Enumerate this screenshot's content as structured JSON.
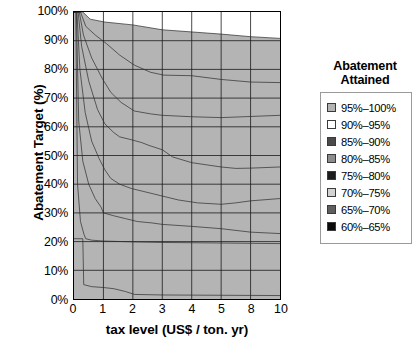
{
  "chart_data": {
    "type": "area",
    "title": "",
    "xlabel": "tax level (US$ / ton. yr)",
    "ylabel": "Abatement Target (%)",
    "legend_title_line1": "Abatement",
    "legend_title_line2": "Attained",
    "legend_position": "right",
    "grid": true,
    "xticks": [
      "0",
      "1",
      "2",
      "3",
      "4",
      "5",
      "8",
      "10"
    ],
    "xtick_values": [
      0,
      1,
      2,
      3,
      4,
      5,
      8,
      10
    ],
    "yticks": [
      "0%",
      "10%",
      "20%",
      "30%",
      "40%",
      "50%",
      "60%",
      "70%",
      "80%",
      "90%",
      "100%"
    ],
    "ytick_values": [
      0,
      10,
      20,
      30,
      40,
      50,
      60,
      70,
      80,
      90,
      100
    ],
    "ylim": [
      0,
      100
    ],
    "xlim": [
      0,
      10
    ],
    "x_scale": "ordinal",
    "legend": [
      {
        "label": "95%–100%",
        "color": "#b4b4b4",
        "low": 95,
        "high": 100
      },
      {
        "label": "90%–95%",
        "color": "#ffffff",
        "low": 90,
        "high": 95
      },
      {
        "label": "85%–90%",
        "color": "#4a4a4a",
        "low": 85,
        "high": 90
      },
      {
        "label": "80%–85%",
        "color": "#8c8c8c",
        "low": 80,
        "high": 85
      },
      {
        "label": "75%–80%",
        "color": "#1c1c1c",
        "low": 75,
        "high": 80
      },
      {
        "label": "70%–75%",
        "color": "#d2d2d2",
        "low": 70,
        "high": 75
      },
      {
        "label": "65%–70%",
        "color": "#5e5e5e",
        "low": 65,
        "high": 70
      },
      {
        "label": "60%–65%",
        "color": "#0a0a0a",
        "low": 60,
        "high": 65
      }
    ],
    "contour_boundaries": [
      {
        "name": "upper_edge_95_100",
        "points": [
          [
            0,
            100
          ],
          [
            0.3,
            100
          ],
          [
            0.55,
            97.5
          ],
          [
            1.05,
            96.5
          ],
          [
            2.0,
            95.5
          ],
          [
            3.0,
            93.8
          ],
          [
            5.0,
            92.3
          ],
          [
            8.0,
            91.4
          ],
          [
            10,
            90.8
          ]
        ]
      },
      {
        "name": "upper_edge_90_95",
        "points": [
          [
            0,
            100
          ],
          [
            0.22,
            100
          ],
          [
            0.4,
            95.0
          ],
          [
            0.72,
            92.0
          ],
          [
            1.1,
            89.0
          ],
          [
            1.55,
            85.0
          ],
          [
            2.05,
            81.5
          ],
          [
            2.6,
            79.0
          ],
          [
            3.05,
            78.0
          ],
          [
            4.0,
            77.8
          ],
          [
            5.0,
            76.5
          ],
          [
            8.0,
            75.6
          ],
          [
            10,
            75.4
          ]
        ]
      },
      {
        "name": "upper_edge_85_90",
        "points": [
          [
            0,
            100
          ],
          [
            0.18,
            100
          ],
          [
            0.32,
            92.0
          ],
          [
            0.6,
            84.0
          ],
          [
            0.95,
            77.0
          ],
          [
            1.25,
            72.0
          ],
          [
            1.6,
            68.5
          ],
          [
            2.05,
            65.5
          ],
          [
            2.6,
            64.5
          ],
          [
            3.0,
            64.0
          ],
          [
            4.0,
            63.5
          ],
          [
            5.0,
            63.2
          ],
          [
            8.0,
            63.6
          ],
          [
            10,
            64.0
          ]
        ]
      },
      {
        "name": "upper_edge_80_85",
        "points": [
          [
            0,
            100
          ],
          [
            0.14,
            100
          ],
          [
            0.26,
            88.0
          ],
          [
            0.5,
            76.0
          ],
          [
            0.8,
            66.0
          ],
          [
            1.05,
            61.0
          ],
          [
            1.35,
            58.0
          ],
          [
            1.55,
            56.5
          ],
          [
            1.95,
            55.5
          ],
          [
            2.3,
            54.5
          ],
          [
            2.55,
            53.5
          ],
          [
            3.0,
            52.0
          ],
          [
            3.35,
            49.5
          ],
          [
            4.0,
            47.5
          ],
          [
            5.0,
            46.0
          ],
          [
            6.5,
            45.5
          ],
          [
            8.0,
            45.6
          ],
          [
            10,
            46.0
          ]
        ]
      },
      {
        "name": "upper_edge_75_80",
        "points": [
          [
            0,
            100
          ],
          [
            0.1,
            100
          ],
          [
            0.2,
            80.0
          ],
          [
            0.38,
            65.0
          ],
          [
            0.6,
            55.0
          ],
          [
            0.85,
            49.0
          ],
          [
            1.05,
            45.0
          ],
          [
            1.25,
            42.0
          ],
          [
            1.55,
            40.0
          ],
          [
            1.95,
            38.5
          ],
          [
            2.35,
            37.5
          ],
          [
            2.95,
            36.0
          ],
          [
            3.55,
            34.5
          ],
          [
            4.2,
            33.5
          ],
          [
            5.0,
            33.0
          ],
          [
            6.5,
            33.5
          ],
          [
            8.0,
            34.2
          ],
          [
            10,
            35.0
          ]
        ]
      },
      {
        "name": "upper_edge_70_75",
        "points": [
          [
            0,
            100
          ],
          [
            0.08,
            100
          ],
          [
            0.16,
            62.0
          ],
          [
            0.3,
            48.0
          ],
          [
            0.5,
            40.0
          ],
          [
            0.72,
            35.0
          ],
          [
            0.92,
            32.0
          ],
          [
            1.0,
            30.0
          ],
          [
            1.35,
            29.0
          ],
          [
            1.75,
            28.0
          ],
          [
            2.15,
            27.0
          ],
          [
            2.65,
            26.5
          ],
          [
            3.0,
            26.0
          ],
          [
            4.0,
            25.3
          ],
          [
            5.0,
            24.5
          ],
          [
            8.0,
            23.3
          ],
          [
            10,
            22.8
          ]
        ]
      },
      {
        "name": "upper_edge_65_70",
        "points": [
          [
            0,
            100
          ],
          [
            0.06,
            100
          ],
          [
            0.12,
            40.0
          ],
          [
            0.22,
            27.0
          ],
          [
            0.34,
            22.5
          ],
          [
            0.4,
            21.0
          ],
          [
            0.6,
            20.5
          ],
          [
            1.0,
            20.2
          ],
          [
            2.0,
            19.9
          ],
          [
            3.0,
            19.7
          ],
          [
            5.0,
            19.5
          ],
          [
            10,
            19.3
          ]
        ]
      },
      {
        "name": "upper_edge_60_65",
        "points": [
          [
            0,
            21.0
          ],
          [
            0.3,
            21.0
          ],
          [
            0.33,
            5.0
          ],
          [
            0.6,
            4.3
          ],
          [
            1.0,
            4.0
          ],
          [
            1.35,
            3.6
          ],
          [
            1.75,
            2.6
          ],
          [
            2.05,
            1.6
          ],
          [
            3.0,
            1.4
          ],
          [
            5.0,
            1.3
          ],
          [
            10,
            1.2
          ]
        ]
      }
    ]
  }
}
